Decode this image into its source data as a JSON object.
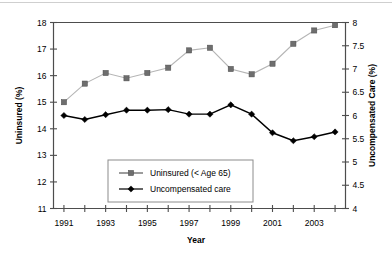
{
  "chart_data": {
    "type": "line",
    "title": "",
    "xlabel": "Year",
    "ylabel": "Uninsured (%)",
    "y2label": "Uncompensated Care (%)",
    "x": [
      1991,
      1992,
      1993,
      1994,
      1995,
      1996,
      1997,
      1998,
      1999,
      2000,
      2001,
      2002,
      2003,
      2004
    ],
    "xtick_labels": [
      "1991",
      "1993",
      "1995",
      "1997",
      "1999",
      "2001",
      "2003"
    ],
    "xtick_values": [
      1991,
      1993,
      1995,
      1997,
      1999,
      2001,
      2003
    ],
    "xlim": [
      1990.5,
      2004.5
    ],
    "ylim": [
      11,
      18
    ],
    "ytick_labels": [
      "11",
      "12",
      "13",
      "14",
      "15",
      "16",
      "17",
      "18"
    ],
    "ytick_values": [
      11,
      12,
      13,
      14,
      15,
      16,
      17,
      18
    ],
    "y2lim": [
      4,
      8
    ],
    "y2tick_labels": [
      "4",
      "4.5",
      "5",
      "5.5",
      "6",
      "6.5",
      "7",
      "7.5",
      "8"
    ],
    "y2tick_values": [
      4,
      4.5,
      5,
      5.5,
      6,
      6.5,
      7,
      7.5,
      8
    ],
    "grid": false,
    "legend_position": "lower-center",
    "series": [
      {
        "name": "Uninsured (< Age 65)",
        "axis": "left",
        "marker": "square",
        "color": "#6e6e6e",
        "line_color": "#b5b5b5",
        "values": [
          15.0,
          15.7,
          16.1,
          15.9,
          16.1,
          16.3,
          16.95,
          17.05,
          16.25,
          16.05,
          16.45,
          17.2,
          17.7,
          17.9
        ]
      },
      {
        "name": "Uncompensated care",
        "axis": "right",
        "marker": "diamond",
        "color": "#000000",
        "line_color": "#000000",
        "values": [
          14.5,
          14.35,
          14.53,
          14.7,
          14.7,
          14.72,
          14.55,
          14.55,
          14.9,
          14.55,
          13.85,
          13.55,
          13.7,
          13.88
        ],
        "values_right_axis": [
          6.0,
          5.91,
          6.02,
          6.11,
          6.11,
          6.13,
          6.03,
          6.03,
          6.23,
          6.03,
          5.63,
          5.46,
          5.54,
          5.65
        ]
      }
    ],
    "legend_entries": [
      "Uninsured (< Age 65)",
      "Uncompensated care"
    ]
  },
  "colors": {
    "uninsured_marker": "#6e6e6e",
    "uninsured_line": "#b5b5b5",
    "uncompensated": "#000000",
    "axis": "#4d4d4d",
    "background": "#ffffff"
  }
}
